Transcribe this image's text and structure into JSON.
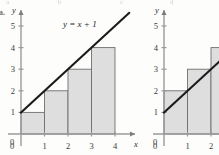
{
  "figure": {
    "item_letter": "a.",
    "bleed_text": [
      "a",
      "b",
      "c",
      "d"
    ]
  },
  "chart_data": [
    {
      "type": "bar",
      "title": "",
      "subtitle": "",
      "xlabel": "x",
      "ylabel": "y",
      "annotation": "y = x + 1",
      "categories": [
        "0",
        "1",
        "2",
        "3",
        "4"
      ],
      "xticks": [
        0,
        1,
        2,
        3,
        4
      ],
      "yticks": [
        0,
        1,
        2,
        3,
        4,
        5
      ],
      "xlim": [
        0,
        5
      ],
      "ylim": [
        0,
        5.8
      ],
      "grid": false,
      "legend": "none",
      "bars": [
        {
          "x0": 0,
          "x1": 1,
          "height": 1
        },
        {
          "x0": 1,
          "x1": 2,
          "height": 2
        },
        {
          "x0": 2,
          "x1": 3,
          "height": 3
        },
        {
          "x0": 3,
          "x1": 4,
          "height": 4
        }
      ],
      "values": [
        1,
        2,
        3,
        4
      ],
      "line": {
        "label": "y = x + 1",
        "slope": 1,
        "intercept": 1,
        "x_start": 0,
        "x_end": 4.6
      }
    },
    {
      "type": "bar",
      "title": "",
      "subtitle": "",
      "xlabel": "",
      "ylabel": "y",
      "annotation": "",
      "categories": [
        "0",
        "1",
        "2"
      ],
      "xticks": [
        0,
        1,
        2
      ],
      "yticks": [
        0,
        1,
        2,
        3,
        4,
        5
      ],
      "xlim": [
        0,
        2.6
      ],
      "ylim": [
        0,
        5.8
      ],
      "grid": false,
      "legend": "none",
      "bars": [
        {
          "x0": 0,
          "x1": 1,
          "height": 2
        },
        {
          "x0": 1,
          "x1": 2,
          "height": 3
        },
        {
          "x0": 2,
          "x1": 3,
          "height": 4
        }
      ],
      "values": [
        2,
        3,
        4
      ],
      "line": {
        "label": "",
        "slope": 1,
        "intercept": 1,
        "x_start": 0,
        "x_end": 2.6
      }
    }
  ],
  "colors": {
    "bar_fill": "#dedede",
    "bar_stroke": "#6f6f6f",
    "line": "#1b1b1b",
    "axis": "#9a9a9a",
    "text": "#3a3a3a",
    "background": "#fdfdfc"
  }
}
